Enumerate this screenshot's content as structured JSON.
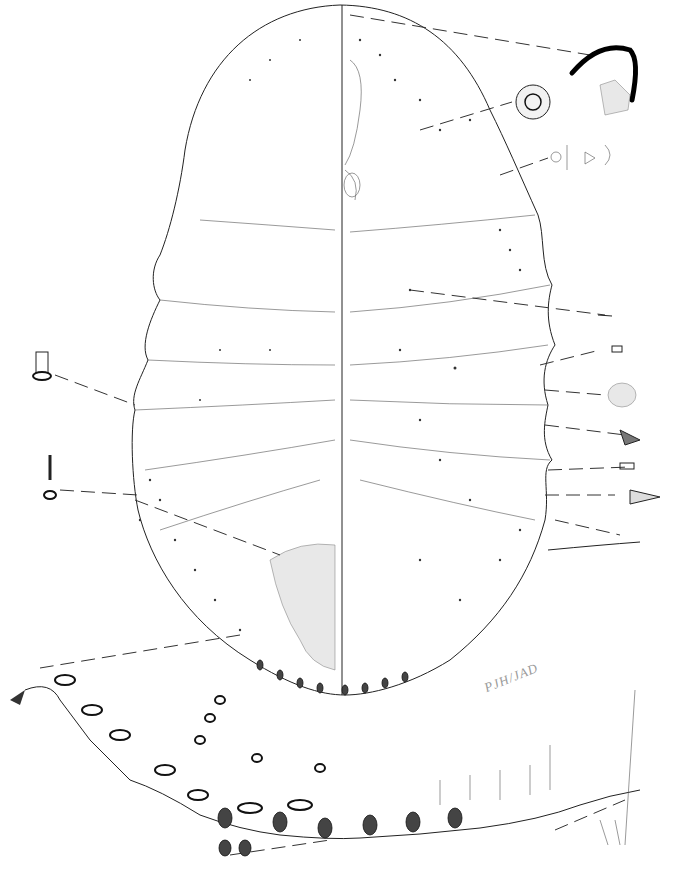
{
  "figure": {
    "type": "scientific-illustration",
    "signature": "PJH/JAD",
    "colors": {
      "background": "#ffffff",
      "ink": "#222222",
      "stipple": "#e8e8e8",
      "signature": "#9a9a9a"
    }
  },
  "insets": [
    {
      "name": "claw-detail",
      "position": "top-right"
    },
    {
      "name": "multilocular-pore",
      "position": "upper-right"
    },
    {
      "name": "tubular-ducts",
      "position": "right"
    },
    {
      "name": "setae-series",
      "position": "right-margin"
    },
    {
      "name": "cruciform-pore",
      "position": "left"
    },
    {
      "name": "marginal-band-enlargement",
      "position": "bottom"
    }
  ]
}
